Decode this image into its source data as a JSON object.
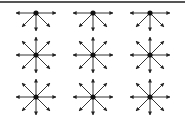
{
  "diagram": {
    "type": "grid-of-directional-nodes",
    "rows": 3,
    "cols": 3,
    "col_x": [
      36,
      93,
      150
    ],
    "row_y": [
      13,
      55,
      97
    ],
    "colors": {
      "stroke": "#333333",
      "node": "#111111",
      "border": "#555555",
      "background": "#ffffff"
    },
    "arrow_length": {
      "horizontal": 20,
      "vertical": 18,
      "diagonal": 14
    },
    "row_directions": [
      [
        "W",
        "E",
        "SW",
        "S",
        "SE"
      ],
      [
        "N",
        "NE",
        "E",
        "SE",
        "S",
        "SW",
        "W",
        "NW"
      ],
      [
        "N",
        "NE",
        "E",
        "SE",
        "S",
        "SW",
        "W",
        "NW"
      ]
    ]
  }
}
